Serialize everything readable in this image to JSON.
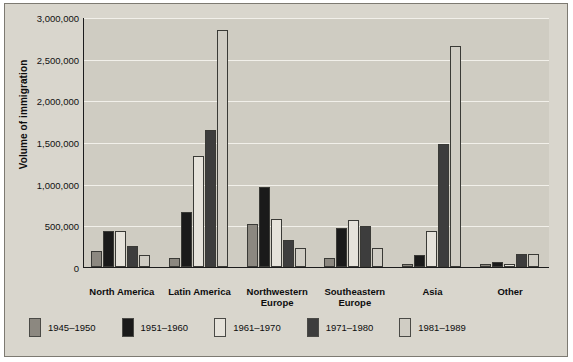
{
  "chart_data": {
    "type": "bar",
    "title": "",
    "xlabel": "",
    "ylabel": "Volume of immigration",
    "ylim": [
      0,
      3000000
    ],
    "ytick_labels": [
      "0",
      "500,000",
      "1,000,000",
      "1,500,000",
      "2,000,000",
      "2,500,000",
      "3,000,000"
    ],
    "ytick_values": [
      0,
      500000,
      1000000,
      1500000,
      2000000,
      2500000,
      3000000
    ],
    "grid": true,
    "legend_position": "bottom",
    "categories": [
      "North America",
      "Latin America",
      "Northwestern\nEurope",
      "Southeastern\nEurope",
      "Asia",
      "Other"
    ],
    "series": [
      {
        "name": "1945–1950",
        "color": "#8c8880",
        "values": [
          190000,
          110000,
          520000,
          110000,
          40000,
          35000
        ]
      },
      {
        "name": "1951–1960",
        "color": "#1a1a1a",
        "values": [
          430000,
          660000,
          960000,
          470000,
          150000,
          55000
        ]
      },
      {
        "name": "1961–1970",
        "color": "#e6e3db",
        "values": [
          430000,
          1330000,
          580000,
          560000,
          430000,
          40000
        ]
      },
      {
        "name": "1971–1980",
        "color": "#3d3d3d",
        "values": [
          250000,
          1640000,
          330000,
          490000,
          1480000,
          160000
        ]
      },
      {
        "name": "1981–1989",
        "color": "#d0cdc4",
        "values": [
          140000,
          2840000,
          230000,
          230000,
          2650000,
          160000
        ]
      }
    ]
  }
}
